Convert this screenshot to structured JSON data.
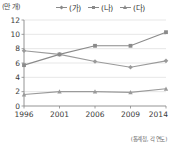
{
  "chart_data": {
    "type": "line",
    "title": "",
    "unit_label": "(만 개)",
    "xlabel": "(년)",
    "ylabel": "",
    "categories": [
      "1996",
      "2001",
      "2006",
      "2009",
      "2014"
    ],
    "x_tick_labels": [
      "1996",
      "2001",
      "2006",
      "2009",
      "2014 (년)"
    ],
    "y_tick_labels": [
      "0",
      "2",
      "4",
      "6",
      "8",
      "10",
      "12"
    ],
    "y_ticks": [
      0,
      2,
      4,
      6,
      8,
      10,
      12
    ],
    "ylim": [
      0,
      12
    ],
    "grid": true,
    "legend_position": "top",
    "series": [
      {
        "name": "(가)",
        "marker": "diamond",
        "color": "#9a9a9a",
        "values": [
          7.7,
          7.2,
          6.2,
          5.4,
          6.3
        ]
      },
      {
        "name": "(나)",
        "marker": "square",
        "color": "#8a8a8a",
        "values": [
          5.7,
          7.2,
          8.4,
          8.4,
          10.3
        ]
      },
      {
        "name": "(다)",
        "marker": "triangle",
        "color": "#9a9a9a",
        "values": [
          1.6,
          2.0,
          2.0,
          1.9,
          2.4
        ]
      }
    ],
    "source_note": "(통계청, 각 연도)"
  },
  "colors": {
    "axis": "#888888",
    "grid": "#dcdcdc",
    "line": "#8e8e8e",
    "text": "#3a3a3a"
  }
}
